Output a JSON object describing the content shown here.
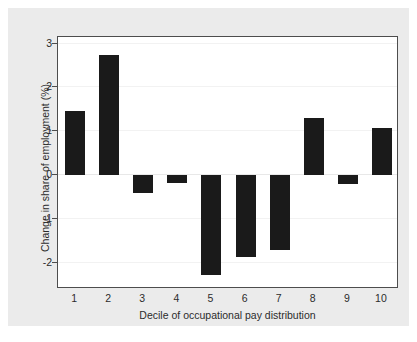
{
  "chart_data": {
    "type": "bar",
    "title": "",
    "xlabel": "Decile of occupational pay distribution",
    "ylabel": "Change in share of employment (%)",
    "categories": [
      "1",
      "2",
      "3",
      "4",
      "5",
      "6",
      "7",
      "8",
      "9",
      "10"
    ],
    "values": [
      1.46,
      2.75,
      -0.41,
      -0.19,
      -2.29,
      -1.88,
      -1.71,
      1.3,
      -0.2,
      1.08
    ],
    "yticks": [
      "3",
      "2",
      "1",
      "0",
      "-1",
      "-2"
    ],
    "ytick_values": [
      3,
      2,
      1,
      0,
      -1,
      -2
    ],
    "ylim": [
      -2.6,
      3.15
    ],
    "grid": true,
    "legend": "none",
    "bar_color": "#1a1a1a",
    "plot_background": "#ffffff",
    "figure_background": "#ebebeb"
  }
}
